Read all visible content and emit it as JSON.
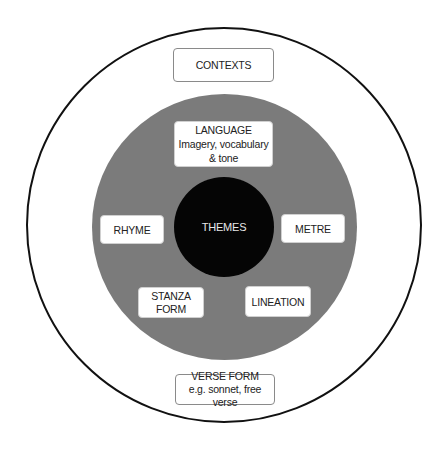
{
  "diagram": {
    "colors": {
      "outer_ring": "#111111",
      "middle_disc": "#7b7b7b",
      "core": "#050505",
      "box_fill": "#ffffff"
    },
    "core": {
      "label": "THEMES"
    },
    "outer_boxes": {
      "contexts": {
        "title": "CONTEXTS"
      },
      "verse_form": {
        "title": "VERSE FORM",
        "subtitle": "e.g. sonnet, free verse"
      }
    },
    "inner_boxes": {
      "language": {
        "title": "LANGUAGE",
        "subtitle_line1": "Imagery, vocabulary",
        "subtitle_line2": "& tone"
      },
      "rhyme": {
        "title": "RHYME"
      },
      "metre": {
        "title": "METRE"
      },
      "stanza_form": {
        "line1": "STANZA",
        "line2": "FORM"
      },
      "lineation": {
        "title": "LINEATION"
      }
    }
  }
}
